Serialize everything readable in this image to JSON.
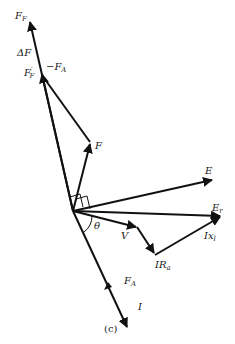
{
  "figure": {
    "caption": "(c)",
    "origin": [
      73,
      211
    ],
    "colors": {
      "ink": "#111111",
      "background": "#ffffff"
    }
  },
  "labels": {
    "F_F": {
      "main": "F",
      "sub": "F"
    },
    "delta_F": {
      "main": "ΔF"
    },
    "F_F_prime": {
      "main": "F",
      "sup": "′",
      "sub": "F"
    },
    "minus_F_A": {
      "main": "−F",
      "sub": "A"
    },
    "F": {
      "main": "F"
    },
    "E": {
      "main": "E"
    },
    "E_r": {
      "main": "E",
      "sub": "r"
    },
    "theta": {
      "main": "θ"
    },
    "V": {
      "main": "V"
    },
    "Ix_l": {
      "main": "Ix",
      "sub": "l"
    },
    "IR_a": {
      "main": "IR",
      "sub": "a"
    },
    "F_A": {
      "main": "F",
      "sub": "A"
    },
    "I": {
      "main": "I"
    }
  },
  "vectors": [
    {
      "name": "F_F",
      "from": [
        73,
        211
      ],
      "to": [
        30,
        20
      ]
    },
    {
      "name": "minus_F_A",
      "from": [
        73,
        211
      ],
      "to": [
        42,
        72
      ]
    },
    {
      "name": "F",
      "from": [
        73,
        211
      ],
      "to": [
        90,
        142
      ]
    },
    {
      "name": "E",
      "from": [
        73,
        211
      ],
      "to": [
        213,
        180
      ]
    },
    {
      "name": "E_r",
      "from": [
        73,
        211
      ],
      "to": [
        222,
        216
      ]
    },
    {
      "name": "V",
      "from": [
        73,
        211
      ],
      "to": [
        138,
        227
      ]
    },
    {
      "name": "IR_a",
      "from": [
        138,
        227
      ],
      "to": [
        155,
        255
      ]
    },
    {
      "name": "Ix_l",
      "from": [
        155,
        255
      ],
      "to": [
        222,
        216
      ]
    },
    {
      "name": "F_A",
      "from": [
        73,
        211
      ],
      "to": [
        128,
        330
      ]
    }
  ]
}
